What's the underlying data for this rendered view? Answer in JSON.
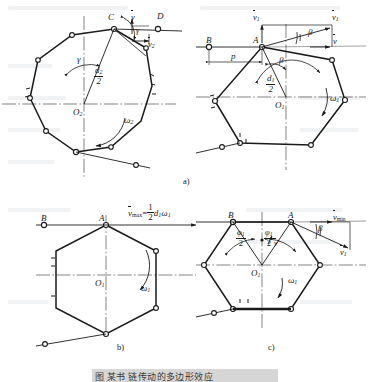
{
  "figure": {
    "panel_tags": [
      "a)",
      "b)",
      "c)"
    ],
    "caption": "图 某书 链传动的多边形效应"
  },
  "colors": {
    "ink": "#1a1a1a",
    "centerline": "#6b6b6b",
    "paper": "#ffffff",
    "caption_bg": "#d6d6d6"
  },
  "panel_a_left": {
    "name": "driven-sprocket-nonagon",
    "center_label": "O",
    "center_sub": "2",
    "contact_point": "C",
    "chain_point": "D",
    "radius_label_num": "d",
    "radius_label_num_sub": "2",
    "radius_label_den": "2",
    "angle_label": "γ",
    "omega_label": "ω",
    "omega_sub": "2",
    "velocity_label": "v",
    "velocity_comp_label": "v",
    "velocity_comp_sub": "2",
    "angle_at_tip": "γ",
    "sides": 9
  },
  "panel_a_right": {
    "name": "driving-sprocket-hexagon",
    "center_label": "O",
    "center_sub": "1",
    "contact_point": "A",
    "chain_point": "B",
    "radius_label_num": "d",
    "radius_label_num_sub": "1",
    "radius_label_den": "2",
    "angle_label": "β",
    "omega_label": "ω",
    "omega_sub": "1",
    "velocity_label": "v",
    "velocity_sub": "1",
    "velocity_perp_label": "v",
    "velocity_perp_sub": "1",
    "velocity_horizontal_label": "v",
    "span_label": "p",
    "sides": 6
  },
  "panel_b": {
    "name": "max-velocity-hexagon",
    "center_label": "O",
    "center_sub": "1",
    "contact_point": "A",
    "chain_point": "B",
    "omega_label": "ω",
    "omega_sub": "1",
    "formula_lead": "v",
    "formula_lead_sub": "max",
    "formula_eq": "=",
    "formula_frac_num": "1",
    "formula_frac_den": "2",
    "formula_tail": "d",
    "formula_tail_sub": "1",
    "formula_omega": "ω",
    "formula_omega_sub": "1",
    "sides": 6
  },
  "panel_c": {
    "name": "min-velocity-hexagon",
    "center_label": "O",
    "center_sub": "1",
    "contact_point": "A",
    "chain_point": "B",
    "omega_label": "ω",
    "omega_sub": "1",
    "half_angle_num": "φ",
    "half_angle_num_sub": "1",
    "half_angle_den": "2",
    "beta_label": "β",
    "vmin_label": "v",
    "vmin_sub": "min",
    "v1_label": "v",
    "v1_sub": "1",
    "vprime_label": "v",
    "vprime_prime": "′",
    "sides": 6
  }
}
